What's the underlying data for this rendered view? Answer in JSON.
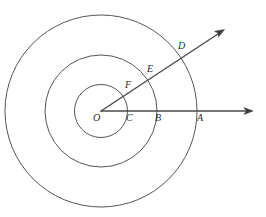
{
  "figure": {
    "kind": "geometry-diagram",
    "background_color": "#ffffff",
    "stroke_color": "#555555",
    "ray_color": "#4a4a4a",
    "label_color": "#2b2b2b",
    "center": {
      "x": 101,
      "y": 111,
      "label": "O"
    },
    "circles": [
      {
        "name": "inner-circle",
        "radius": 26.5,
        "cx": 101,
        "cy": 111
      },
      {
        "name": "middle-circle",
        "radius": 56,
        "cx": 101,
        "cy": 111
      },
      {
        "name": "outer-circle",
        "radius": 96,
        "cx": 101,
        "cy": 111
      }
    ],
    "rays": [
      {
        "name": "horizontal-ray",
        "from": {
          "x": 101,
          "y": 111
        },
        "to": {
          "x": 253,
          "y": 111
        },
        "angle_degrees": 0,
        "arrowhead": true
      },
      {
        "name": "diagonal-ray",
        "from": {
          "x": 101,
          "y": 111
        },
        "to": {
          "x": 224,
          "y": 30
        },
        "angle_degrees": 33,
        "arrowhead": true
      }
    ],
    "labels": [
      {
        "id": "O",
        "text": "O",
        "x": 93,
        "y": 113,
        "on": "center"
      },
      {
        "id": "C",
        "text": "C",
        "x": 126,
        "y": 113,
        "on": "horizontal-ray-inner-circle-intersection"
      },
      {
        "id": "B",
        "text": "B",
        "x": 155,
        "y": 113,
        "on": "horizontal-ray-middle-circle-intersection"
      },
      {
        "id": "A",
        "text": "A",
        "x": 197,
        "y": 113,
        "on": "horizontal-ray-outer-circle-intersection"
      },
      {
        "id": "F",
        "text": "F",
        "x": 125,
        "y": 80,
        "on": "diagonal-ray-inner-circle-intersection"
      },
      {
        "id": "E",
        "text": "E",
        "x": 147,
        "y": 64,
        "on": "diagonal-ray-middle-circle-intersection"
      },
      {
        "id": "D",
        "text": "D",
        "x": 178,
        "y": 41,
        "on": "diagonal-ray-outer-circle-intersection"
      }
    ]
  }
}
